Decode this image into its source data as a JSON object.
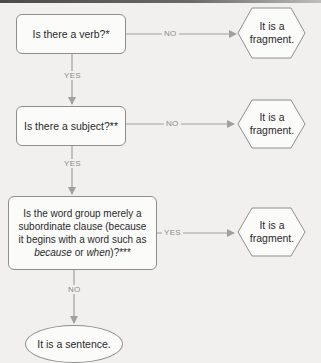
{
  "flowchart": {
    "questions": [
      {
        "id": "q1",
        "text": "Is there a verb?*",
        "no_label": "NO",
        "yes_label": "YES"
      },
      {
        "id": "q2",
        "text": "Is there a subject?**",
        "no_label": "NO",
        "yes_label": "YES"
      },
      {
        "id": "q3",
        "text_parts": {
          "line1": "Is the word group merely a",
          "line2": "subordinate clause (because",
          "line3": "it begins with a word such as",
          "em1": "because",
          "mid": " or ",
          "em2": "when",
          "end": ")?***"
        },
        "yes_label": "YES",
        "no_label": "NO"
      }
    ],
    "outcomes": {
      "fragment_line1": "It is a",
      "fragment_line2": "fragment.",
      "sentence": "It is a sentence."
    },
    "colors": {
      "background": "#f1f0ee",
      "box_fill": "#fbfbfa",
      "border": "#8e8e8e",
      "connector": "#a0a0a0",
      "label": "#8a8a8a"
    }
  }
}
